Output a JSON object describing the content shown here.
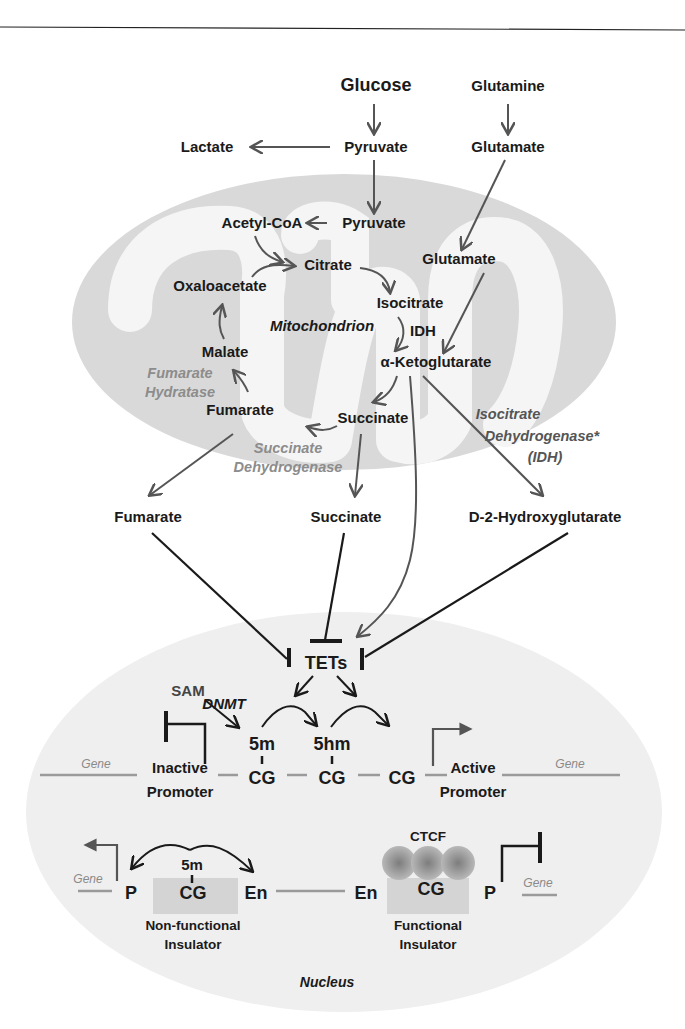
{
  "colors": {
    "mitochondrion_outer": "#d9d9d9",
    "mitochondrion_inner": "#f5f5f5",
    "nucleus": "#efefef",
    "arrow_gray": "#555555",
    "inhibit_black": "#1a1a1a",
    "enzyme_label": "#8c8c8c",
    "dna_line": "#9a9a9a",
    "ctcf": "#9a9a9a",
    "insulator_box": "#d4d4d4"
  },
  "cytoplasm": {
    "glucose": "Glucose",
    "glutamine": "Glutamine",
    "lactate": "Lactate",
    "pyruvate": "Pyruvate",
    "glutamate": "Glutamate"
  },
  "mitochondrion": {
    "label": "Mitochondrion",
    "acetyl_coa": "Acetyl-CoA",
    "pyruvate": "Pyruvate",
    "citrate": "Citrate",
    "glutamate": "Glutamate",
    "oxaloacetate": "Oxaloacetate",
    "isocitrate": "Isocitrate",
    "idh": "IDH",
    "malate": "Malate",
    "alpha_kg": "α-Ketoglutarate",
    "fumarate": "Fumarate",
    "succinate": "Succinate",
    "enzymes": {
      "fumarate_hydratase": [
        "Fumarate",
        "Hydratase"
      ],
      "succinate_dehydrogenase": [
        "Succinate",
        "Dehydrogenase"
      ],
      "isocitrate_dehydrogenase": [
        "Isocitrate",
        "Dehydrogenase*",
        "(IDH)"
      ]
    }
  },
  "oncometabolites": {
    "fumarate": "Fumarate",
    "succinate": "Succinate",
    "d2hg": "D-2-Hydroxyglutarate"
  },
  "nucleus": {
    "label": "Nucleus",
    "tets": "TETs",
    "sam": "SAM",
    "dnmt": "DNMT",
    "mark_5m": "5m",
    "mark_5hm": "5hm",
    "cg": "CG",
    "gene": "Gene",
    "inactive_promoter": [
      "Inactive",
      "Promoter"
    ],
    "active_promoter": [
      "Active",
      "Promoter"
    ],
    "p": "P",
    "en": "En",
    "ctcf": "CTCF",
    "nonfunctional_insulator": [
      "Non-functional",
      "Insulator"
    ],
    "functional_insulator": [
      "Functional",
      "Insulator"
    ]
  }
}
